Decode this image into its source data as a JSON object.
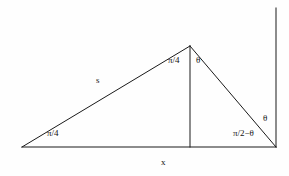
{
  "figure": {
    "stroke_color": "#1a1a1a",
    "background_color": "#fefefe",
    "geometry": {
      "left_vertex": {
        "x": 22,
        "y": 147
      },
      "apex": {
        "x": 190,
        "y": 46
      },
      "right_vertex": {
        "x": 276,
        "y": 147
      },
      "foot_of_altitude": {
        "x": 190,
        "y": 147
      },
      "reference_line_top": {
        "x": 276,
        "y": 8
      }
    },
    "labels": {
      "apex_left_angle": "π/4",
      "apex_right_angle": "θ",
      "base_left_angle": "π/4",
      "base_right_angle": "π/2−θ",
      "exterior_theta": "θ",
      "left_side": "s",
      "base": "x"
    }
  }
}
